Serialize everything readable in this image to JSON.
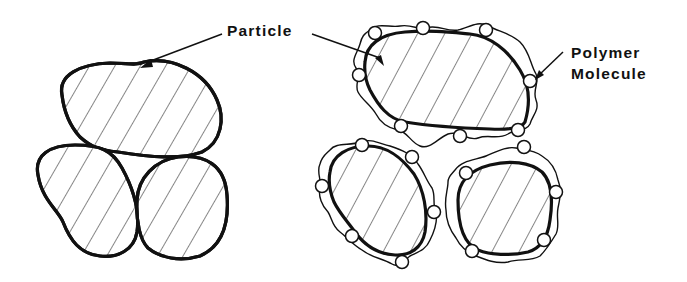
{
  "diagram": {
    "type": "schematic",
    "labels": {
      "particle": "Particle",
      "polymer_line1": "Polymer",
      "polymer_line2": "Molecule"
    },
    "left_group": {
      "description": "Three bare hatched particles in contact (clustered)",
      "particle_count": 3
    },
    "right_group": {
      "description": "Three hatched particles each surrounded by a wavy adsorbed polymer layer with small circular segments, kept apart",
      "particle_count": 3
    },
    "colors": {
      "ink": "#111111",
      "background": "#ffffff"
    }
  }
}
